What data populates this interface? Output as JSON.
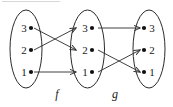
{
  "figure": {
    "stroke_color": "#2b2b2b",
    "dot_color": "#111111",
    "background": "#ffffff",
    "sets": [
      {
        "id": "domain",
        "label_side": "left",
        "elements": [
          {
            "label": "3",
            "row": 0
          },
          {
            "label": "2",
            "row": 1
          },
          {
            "label": "1",
            "row": 2
          }
        ]
      },
      {
        "id": "codomain-f",
        "label_side": "left",
        "elements": [
          {
            "label": "3",
            "row": 0
          },
          {
            "label": "2",
            "row": 1
          },
          {
            "label": "1",
            "row": 2
          }
        ]
      },
      {
        "id": "codomain-g",
        "label_side": "right",
        "elements": [
          {
            "label": "3",
            "row": 0
          },
          {
            "label": "2",
            "row": 1
          },
          {
            "label": "1",
            "row": 2
          }
        ]
      }
    ],
    "maps": [
      {
        "name": "f",
        "label": "f",
        "from": "domain",
        "to": "codomain-f",
        "arrows": [
          {
            "from": "3",
            "to": "2"
          },
          {
            "from": "2",
            "to": "3"
          },
          {
            "from": "1",
            "to": "1"
          }
        ]
      },
      {
        "name": "g",
        "label": "g",
        "from": "codomain-f",
        "to": "codomain-g",
        "arrows": [
          {
            "from": "3",
            "to": "3"
          },
          {
            "from": "2",
            "to": "1"
          },
          {
            "from": "1",
            "to": "2"
          }
        ]
      }
    ]
  }
}
